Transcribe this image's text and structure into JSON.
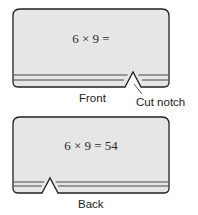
{
  "front_card": {
    "equation": "6 × 9 =",
    "label": "Front",
    "notch_label": "Cut notch"
  },
  "back_card": {
    "equation": "6 × 9 = 54",
    "label": "Back"
  },
  "colors": {
    "card_fill": "#e6e6e6",
    "card_stroke": "#222222",
    "stripe": "#444444"
  }
}
